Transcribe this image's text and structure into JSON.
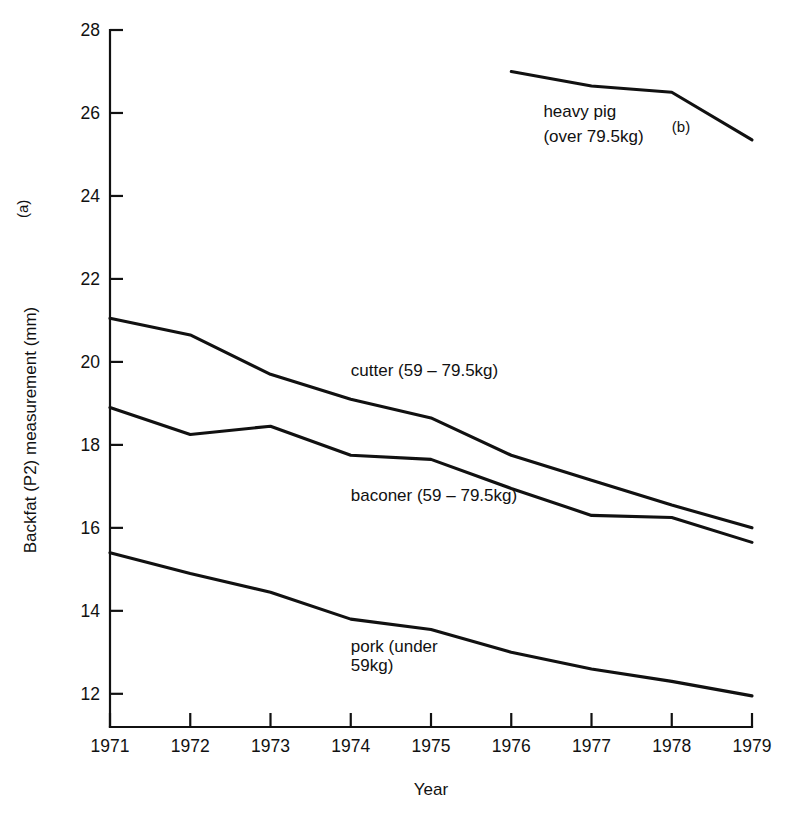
{
  "chart_data": {
    "type": "line",
    "title": "",
    "xlabel": "Year",
    "ylabel": "Backfat (P2) measurement (mm)",
    "ylabel_note": "(a)",
    "x": [
      1971,
      1972,
      1973,
      1974,
      1975,
      1976,
      1977,
      1978,
      1979
    ],
    "categories": [
      "1971",
      "1972",
      "1973",
      "1974",
      "1975",
      "1976",
      "1977",
      "1978",
      "1979"
    ],
    "xlim": [
      1971,
      1979
    ],
    "ylim": [
      11.2,
      28
    ],
    "yticks": [
      12,
      14,
      16,
      18,
      20,
      22,
      24,
      26,
      28
    ],
    "ytick_labels": [
      "12",
      "14",
      "16",
      "18",
      "20",
      "22",
      "24",
      "26",
      "28"
    ],
    "grid": false,
    "legend_position": "inline-annotations",
    "series": [
      {
        "name": "heavy pig (over 79.5kg)",
        "label_line1": "heavy pig",
        "label_line2": "(over 79.5kg)",
        "label_note": "(b)",
        "x": [
          1976,
          1977,
          1978,
          1979
        ],
        "values": [
          27.0,
          26.65,
          26.5,
          25.35
        ]
      },
      {
        "name": "cutter (59 – 79.5kg)",
        "label_line1": "cutter (59 – 79.5kg)",
        "label_line2": "",
        "label_note": "",
        "x": [
          1971,
          1972,
          1973,
          1974,
          1975,
          1976,
          1977,
          1978,
          1979
        ],
        "values": [
          21.05,
          20.65,
          19.7,
          19.1,
          18.65,
          17.75,
          17.15,
          16.55,
          16.0
        ]
      },
      {
        "name": "baconer (59 – 79.5kg)",
        "label_line1": "baconer (59 – 79.5kg)",
        "label_line2": "",
        "label_note": "",
        "x": [
          1971,
          1972,
          1973,
          1974,
          1975,
          1976,
          1977,
          1978,
          1979
        ],
        "values": [
          18.9,
          18.25,
          18.45,
          17.75,
          17.65,
          16.95,
          16.3,
          16.25,
          15.65
        ]
      },
      {
        "name": "pork (under 59kg)",
        "label_line1": "pork (under",
        "label_line2": "59kg)",
        "label_note": "",
        "x": [
          1971,
          1972,
          1973,
          1974,
          1975,
          1976,
          1977,
          1978,
          1979
        ],
        "values": [
          15.4,
          14.9,
          14.45,
          13.8,
          13.55,
          13.0,
          12.6,
          12.3,
          11.95
        ]
      }
    ],
    "annotations": [
      {
        "text": "cutter (59 – 79.5kg)",
        "x": 1974.0,
        "y": 19.65
      },
      {
        "text": "baconer (59 – 79.5kg)",
        "x": 1974.0,
        "y": 16.65
      },
      {
        "text": "pork (under",
        "x": 1974.0,
        "y": 13.0
      },
      {
        "text": "59kg)",
        "x": 1974.0,
        "y": 12.55
      },
      {
        "text": "heavy pig",
        "x": 1976.4,
        "y": 25.9
      },
      {
        "text": "(over 79.5kg)",
        "x": 1976.4,
        "y": 25.3
      },
      {
        "text": "(b)",
        "x": 1978.0,
        "y": 25.55
      }
    ],
    "colors": {
      "line": "#111111",
      "axis": "#111111",
      "background": "#ffffff"
    }
  }
}
